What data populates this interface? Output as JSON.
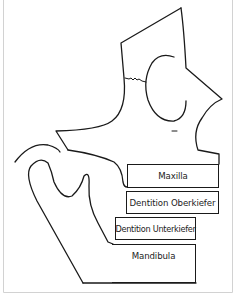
{
  "diagram": {
    "type": "anatomical-schematic",
    "labels": {
      "maxilla": "Maxilla",
      "dentition_upper": "Dentition Oberkiefer",
      "dentition_lower": "Dentition Unterkiefer",
      "mandible": "Mandibula"
    },
    "colors": {
      "line": "#1a1a1a",
      "frame": "#d0d0d0",
      "background": "#ffffff"
    }
  }
}
